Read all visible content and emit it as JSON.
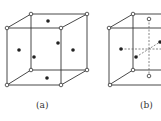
{
  "figures": [
    {
      "id": "a",
      "label": "(a)",
      "type": "face-centered cubic unit cell"
    },
    {
      "id": "b",
      "label": "(b)",
      "type": "cubic cell with internal dashed axes"
    }
  ],
  "colors": {
    "line": "#333333",
    "dot": "#222222",
    "background": "#ffffff"
  }
}
